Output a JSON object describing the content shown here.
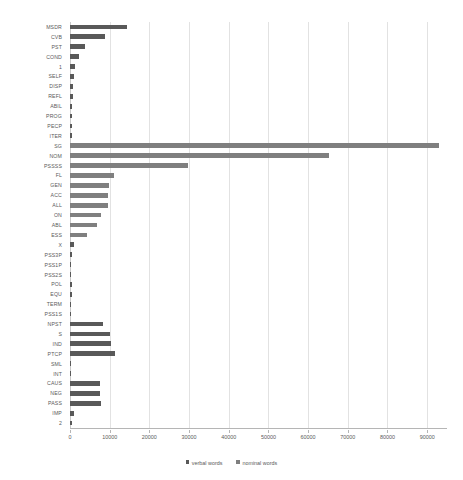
{
  "chart_data": {
    "type": "bar",
    "orientation": "horizontal",
    "title": "",
    "xlabel": "",
    "ylabel": "",
    "xlim": [
      0,
      95000
    ],
    "grid": true,
    "legend_position": "bottom",
    "xticks": [
      0,
      10000,
      20000,
      30000,
      40000,
      50000,
      60000,
      70000,
      80000,
      90000
    ],
    "xticklabels": [
      "0",
      "10000",
      "20000",
      "30000",
      "40000",
      "50000",
      "60000",
      "70000",
      "80000",
      "90000"
    ],
    "categories": [
      "MSDR",
      "CVB",
      "PST",
      "COND",
      "1",
      "SELF",
      "DISP",
      "REFL",
      "ABIL",
      "PROG",
      "PECP",
      "ITER",
      "SG",
      "NOM",
      "PSSSS",
      "FL",
      "GEN",
      "ACC",
      "ALL",
      "ON",
      "ABL",
      "ESS",
      "X",
      "PSS3P",
      "PSS1P",
      "PSS2S",
      "POL",
      "EQU",
      "TERM",
      "PSS1S",
      "NPST",
      "S",
      "IND",
      "PTCP",
      "SML",
      "INT",
      "CAUS",
      "NEG",
      "PASS",
      "IMP",
      "2"
    ],
    "series": [
      {
        "name": "verbal words",
        "color": "#595959",
        "values": [
          14300,
          8900,
          3700,
          2300,
          1300,
          900,
          700,
          700,
          600,
          600,
          500,
          400,
          0,
          0,
          0,
          0,
          0,
          0,
          0,
          0,
          0,
          0,
          1000,
          400,
          300,
          300,
          400,
          400,
          200,
          200,
          8200,
          10200,
          10400,
          11300,
          300,
          300,
          7600,
          7500,
          7900,
          1100,
          500
        ]
      },
      {
        "name": "nominal words",
        "color": "#7f7f7f",
        "values": [
          0,
          0,
          0,
          0,
          0,
          0,
          0,
          0,
          0,
          0,
          0,
          0,
          93000,
          65200,
          29700,
          11200,
          9900,
          9700,
          9500,
          7700,
          6700,
          4300,
          0,
          0,
          0,
          0,
          0,
          0,
          0,
          0,
          0,
          0,
          0,
          0,
          0,
          0,
          0,
          0,
          0,
          0,
          0
        ]
      }
    ],
    "legend": [
      "verbal words",
      "nominal words"
    ]
  }
}
